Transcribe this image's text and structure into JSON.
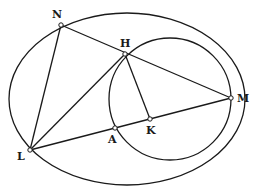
{
  "diagram": {
    "type": "geometric-figure",
    "colors": {
      "ink": "#1a1a1a",
      "background": "#ffffff"
    },
    "outer_ellipse": {
      "cx": 127,
      "cy": 99,
      "rx": 118,
      "ry": 86
    },
    "inner_circle": {
      "cx": 170,
      "cy": 99,
      "r": 61
    },
    "points": [
      {
        "id": "N",
        "label": "N",
        "x": 61,
        "y": 25,
        "lx": 52,
        "ly": 18
      },
      {
        "id": "H",
        "label": "H",
        "x": 125,
        "y": 54,
        "lx": 120,
        "ly": 47
      },
      {
        "id": "M",
        "label": "M",
        "x": 231,
        "y": 98,
        "lx": 237,
        "ly": 102
      },
      {
        "id": "L",
        "label": "L",
        "x": 30,
        "y": 150,
        "lx": 17,
        "ly": 160
      },
      {
        "id": "A",
        "label": "A",
        "x": 115,
        "y": 128,
        "lx": 108,
        "ly": 143
      },
      {
        "id": "K",
        "label": "K",
        "x": 150,
        "y": 119,
        "lx": 146,
        "ly": 134
      }
    ],
    "segments": [
      {
        "from": "N",
        "to": "M"
      },
      {
        "from": "N",
        "to": "L"
      },
      {
        "from": "L",
        "to": "H"
      },
      {
        "from": "L",
        "to": "M"
      },
      {
        "from": "H",
        "to": "K"
      }
    ]
  }
}
